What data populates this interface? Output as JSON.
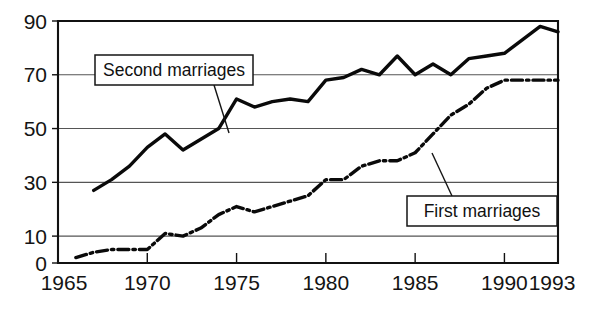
{
  "chart_data": {
    "type": "line",
    "title": "",
    "subtitle": "",
    "xlabel": "",
    "ylabel": "",
    "xlim": [
      1965,
      1993
    ],
    "ylim": [
      0,
      90
    ],
    "grid": true,
    "grid_axis": "y",
    "legend_position": "inline-callout",
    "x_ticks": [
      1965,
      1970,
      1975,
      1980,
      1985,
      1990,
      1993
    ],
    "x_tick_labels": [
      "1965",
      "1970",
      "1975",
      "1980",
      "1985",
      "1990",
      "1993"
    ],
    "y_ticks": [
      0,
      10,
      30,
      50,
      70,
      90
    ],
    "y_tick_labels": [
      "0",
      "10",
      "30",
      "50",
      "70",
      "90"
    ],
    "annotations": [
      {
        "name": "second-marriages-callout",
        "text": "Second marriages",
        "points_to_year": 1974,
        "points_to_value": 50
      },
      {
        "name": "first-marriages-callout",
        "text": "First marriages",
        "points_to_year": 1985,
        "points_to_value": 41
      }
    ],
    "series": [
      {
        "name": "Second marriages",
        "style": "solid",
        "color": "#0a0a0a",
        "x": [
          1967,
          1968,
          1969,
          1970,
          1971,
          1972,
          1973,
          1974,
          1975,
          1976,
          1977,
          1978,
          1979,
          1980,
          1981,
          1982,
          1983,
          1984,
          1985,
          1986,
          1987,
          1988,
          1989,
          1990,
          1991,
          1992,
          1993
        ],
        "values": [
          27,
          31,
          36,
          43,
          48,
          42,
          46,
          50,
          61,
          58,
          60,
          61,
          60,
          68,
          69,
          72,
          70,
          77,
          70,
          74,
          70,
          76,
          77,
          78,
          83,
          88,
          86
        ]
      },
      {
        "name": "First marriages",
        "style": "dash-dot",
        "color": "#0a0a0a",
        "x": [
          1966,
          1967,
          1968,
          1969,
          1970,
          1971,
          1972,
          1973,
          1974,
          1975,
          1976,
          1977,
          1978,
          1979,
          1980,
          1981,
          1982,
          1983,
          1984,
          1985,
          1986,
          1987,
          1988,
          1989,
          1990,
          1991,
          1992,
          1993
        ],
        "values": [
          2,
          4,
          5,
          5,
          5,
          11,
          10,
          13,
          18,
          21,
          19,
          21,
          23,
          25,
          31,
          31,
          36,
          38,
          38,
          41,
          48,
          55,
          59,
          65,
          68,
          68,
          68,
          68
        ]
      }
    ]
  }
}
